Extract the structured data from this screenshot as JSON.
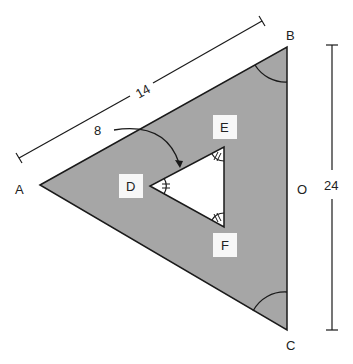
{
  "diagram": {
    "type": "geometry",
    "colors": {
      "shade": "#a6a6a6",
      "stroke": "#1a1a1a",
      "label_box": "#f7f7f7",
      "background": "#ffffff"
    },
    "vertices": {
      "A": "A",
      "B": "B",
      "C": "C",
      "O": "O",
      "D": "D",
      "E": "E",
      "F": "F"
    },
    "measurements": {
      "side_AB": "14",
      "inner_offset": "8",
      "height_BC": "24"
    }
  }
}
